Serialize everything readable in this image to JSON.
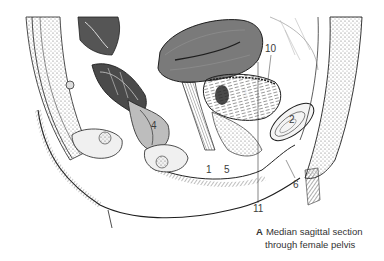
{
  "figure": {
    "title": "Median sagittal section through female pelvis",
    "colors": {
      "ink": "#1e1e1e",
      "tissue_light": "#e6e6e6",
      "tissue_mid": "#9a9a9a",
      "tissue_dark": "#5a5a5a",
      "background": "#ffffff"
    },
    "labels": [
      {
        "id": "1",
        "text": "1",
        "x": 206,
        "y": 165
      },
      {
        "id": "2",
        "text": "2",
        "x": 289,
        "y": 115
      },
      {
        "id": "3",
        "text": "3",
        "x": 242,
        "y": 89
      },
      {
        "id": "4",
        "text": "4",
        "x": 151,
        "y": 121
      },
      {
        "id": "5",
        "text": "5",
        "x": 224,
        "y": 165
      },
      {
        "id": "6",
        "text": "6",
        "x": 293,
        "y": 180
      },
      {
        "id": "10",
        "text": "10",
        "x": 265,
        "y": 44
      },
      {
        "id": "11",
        "text": "11",
        "x": 254,
        "y": 203
      }
    ]
  },
  "caption": {
    "letter": "A",
    "line1": "Median sagittal section",
    "line2": "through female pelvis"
  }
}
